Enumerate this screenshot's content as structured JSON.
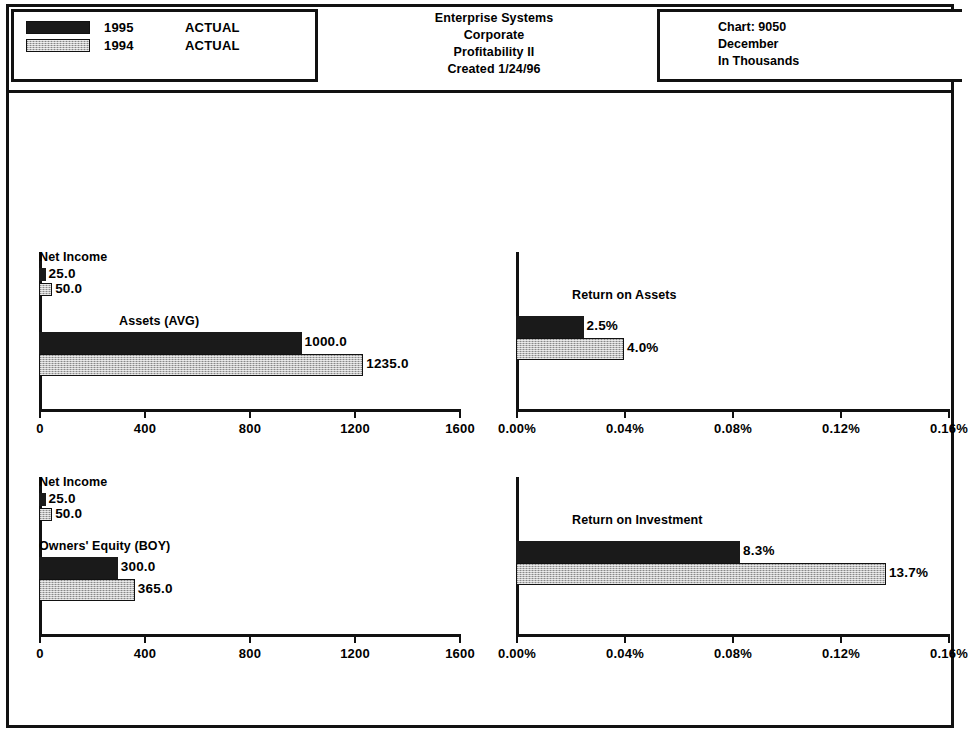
{
  "header": {
    "legend": {
      "rows": [
        {
          "swatch": "dark",
          "year": "1995",
          "scenario": "ACTUAL"
        },
        {
          "swatch": "light",
          "year": "1994",
          "scenario": "ACTUAL"
        }
      ]
    },
    "title_lines": [
      "Enterprise Systems",
      "Corporate",
      "Profitability II",
      "Created 1/24/96"
    ],
    "info_lines": [
      "Chart:  9050",
      "December",
      "In Thousands"
    ]
  },
  "chart_data": [
    {
      "id": "assets-panel",
      "type": "bar",
      "orientation": "horizontal",
      "title": "",
      "xlabel": "",
      "ylabel": "",
      "xlim": [
        0,
        1600
      ],
      "grid": false,
      "legend_position": "top-left-external",
      "tick_labels": [
        "0",
        "400",
        "800",
        "1200",
        "1600"
      ],
      "ticks": [
        0,
        400,
        800,
        1200,
        1600
      ],
      "categories": [
        "Net Income",
        "Assets (AVG)"
      ],
      "series": [
        {
          "name": "1995",
          "values": [
            25.0,
            1000.0
          ],
          "labels": [
            "25.0",
            "1000.0"
          ],
          "color": "#1a1a1a"
        },
        {
          "name": "1994",
          "values": [
            50.0,
            1235.0
          ],
          "labels": [
            "50.0",
            "1235.0"
          ],
          "color": "#bcbcbc"
        }
      ]
    },
    {
      "id": "return-on-assets-panel",
      "type": "bar",
      "orientation": "horizontal",
      "title": "Return on Assets",
      "xlabel": "",
      "ylabel": "",
      "xlim": [
        0,
        0.16
      ],
      "grid": false,
      "legend_position": "top-left-external",
      "tick_labels": [
        "0.00%",
        "0.04%",
        "0.08%",
        "0.12%",
        "0.16%"
      ],
      "ticks": [
        0.0,
        0.04,
        0.08,
        0.12,
        0.16
      ],
      "categories": [
        "Return on Assets"
      ],
      "series": [
        {
          "name": "1995",
          "values": [
            0.025
          ],
          "labels": [
            "2.5%"
          ],
          "color": "#1a1a1a"
        },
        {
          "name": "1994",
          "values": [
            0.04
          ],
          "labels": [
            "4.0%"
          ],
          "color": "#bcbcbc"
        }
      ]
    },
    {
      "id": "owners-equity-panel",
      "type": "bar",
      "orientation": "horizontal",
      "title": "",
      "xlabel": "",
      "ylabel": "",
      "xlim": [
        0,
        1600
      ],
      "grid": false,
      "legend_position": "top-left-external",
      "tick_labels": [
        "0",
        "400",
        "800",
        "1200",
        "1600"
      ],
      "ticks": [
        0,
        400,
        800,
        1200,
        1600
      ],
      "categories": [
        "Net Income",
        "Owners' Equity (BOY)"
      ],
      "series": [
        {
          "name": "1995",
          "values": [
            25.0,
            300.0
          ],
          "labels": [
            "25.0",
            "300.0"
          ],
          "color": "#1a1a1a"
        },
        {
          "name": "1994",
          "values": [
            50.0,
            365.0
          ],
          "labels": [
            "50.0",
            "365.0"
          ],
          "color": "#bcbcbc"
        }
      ]
    },
    {
      "id": "return-on-investment-panel",
      "type": "bar",
      "orientation": "horizontal",
      "title": "Return on Investment",
      "xlabel": "",
      "ylabel": "",
      "xlim": [
        0,
        0.16
      ],
      "grid": false,
      "legend_position": "top-left-external",
      "tick_labels": [
        "0.00%",
        "0.04%",
        "0.08%",
        "0.12%",
        "0.16%"
      ],
      "ticks": [
        0.0,
        0.04,
        0.08,
        0.12,
        0.16
      ],
      "categories": [
        "Return on Investment"
      ],
      "series": [
        {
          "name": "1995",
          "values": [
            0.083
          ],
          "labels": [
            "8.3%"
          ],
          "color": "#1a1a1a"
        },
        {
          "name": "1994",
          "values": [
            0.137
          ],
          "labels": [
            "13.7%"
          ],
          "color": "#bcbcbc"
        }
      ]
    }
  ],
  "layout": {
    "panels": [
      {
        "dom": "panel-tl",
        "axis_px": 420,
        "groups": [
          {
            "label_key": 0,
            "label_top": -2,
            "label_left": 6,
            "bar_top": 16,
            "bar_h": 13,
            "gap": 2
          },
          {
            "label_key": 1,
            "label_top": 62,
            "label_left": 86,
            "bar_top": 80,
            "bar_h": 22,
            "gap": 0
          }
        ]
      },
      {
        "dom": "panel-tr",
        "axis_px": 432,
        "groups": [
          {
            "label_key": 0,
            "label_top": 36,
            "label_left": 62,
            "bar_top": 64,
            "bar_h": 22,
            "gap": 0
          }
        ]
      },
      {
        "dom": "panel-bl",
        "axis_px": 420,
        "groups": [
          {
            "label_key": 0,
            "label_top": -2,
            "label_left": 6,
            "bar_top": 16,
            "bar_h": 13,
            "gap": 2
          },
          {
            "label_key": 1,
            "label_top": 62,
            "label_left": 6,
            "bar_top": 80,
            "bar_h": 22,
            "gap": 0
          }
        ]
      },
      {
        "dom": "panel-br",
        "axis_px": 432,
        "groups": [
          {
            "label_key": 0,
            "label_top": 36,
            "label_left": 62,
            "bar_top": 64,
            "bar_h": 22,
            "gap": 0
          }
        ]
      }
    ]
  }
}
